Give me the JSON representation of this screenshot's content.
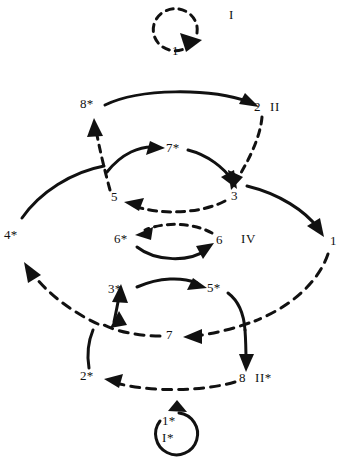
{
  "figure": {
    "type": "diagram",
    "style": "hand-drawn line diagram of two nested cycles",
    "stroke_color": "#111111",
    "background_color": "#ffffff"
  },
  "nodes": [
    {
      "id": "n1",
      "label": "1",
      "x": 176,
      "y": 50
    },
    {
      "id": "n8s",
      "label": "8*",
      "x": 86,
      "y": 104
    },
    {
      "id": "n2",
      "label": "2",
      "x": 258,
      "y": 108
    },
    {
      "id": "n7s",
      "label": "7*",
      "x": 172,
      "y": 148
    },
    {
      "id": "n5",
      "label": "5",
      "x": 115,
      "y": 198
    },
    {
      "id": "n3",
      "label": "3",
      "x": 234,
      "y": 196
    },
    {
      "id": "n4s",
      "label": "4*",
      "x": 8,
      "y": 235
    },
    {
      "id": "n6s",
      "label": "6*",
      "x": 120,
      "y": 239
    },
    {
      "id": "n6",
      "label": "6",
      "x": 220,
      "y": 240
    },
    {
      "id": "n1r",
      "label": "1",
      "x": 330,
      "y": 241
    },
    {
      "id": "n3s",
      "label": "3*",
      "x": 114,
      "y": 289
    },
    {
      "id": "n5s",
      "label": "5*",
      "x": 211,
      "y": 288
    },
    {
      "id": "n7",
      "label": "7",
      "x": 170,
      "y": 335
    },
    {
      "id": "n2s",
      "label": "2*",
      "x": 86,
      "y": 376
    },
    {
      "id": "n8",
      "label": "8",
      "x": 243,
      "y": 378
    },
    {
      "id": "n1s",
      "label": "1*",
      "x": 166,
      "y": 421
    }
  ],
  "roman_labels": [
    {
      "id": "r1",
      "label": "I",
      "x": 231,
      "y": 14
    },
    {
      "id": "r2",
      "label": "II",
      "x": 273,
      "y": 106
    },
    {
      "id": "r4",
      "label": "IV",
      "x": 245,
      "y": 238
    },
    {
      "id": "r2s",
      "label": "II*",
      "x": 259,
      "y": 377
    },
    {
      "id": "r1s",
      "label": "I*",
      "x": 166,
      "y": 437
    }
  ],
  "edges": [
    {
      "id": "e-1-1",
      "from": "1",
      "to": "1",
      "style": "dashed",
      "shape": "self-loop",
      "cycle": "I"
    },
    {
      "id": "e-8s-2",
      "from": "8*",
      "to": "2",
      "style": "solid",
      "shape": "arc-top"
    },
    {
      "id": "e-2-3",
      "from": "2",
      "to": "3",
      "style": "dashed",
      "shape": "line-down"
    },
    {
      "id": "e-3-5",
      "from": "3",
      "to": "5",
      "style": "dashed",
      "shape": "arc"
    },
    {
      "id": "e-5-8s",
      "from": "5",
      "to": "8*",
      "style": "dashed",
      "shape": "line-up"
    },
    {
      "id": "e-5-7s",
      "from": "5",
      "to": "7*",
      "style": "solid",
      "shape": "arc-up-right"
    },
    {
      "id": "e-7s-3",
      "from": "7*",
      "to": "3",
      "style": "solid",
      "shape": "arc-down-right"
    },
    {
      "id": "e-6-6s",
      "from": "6",
      "to": "6*",
      "style": "dashed",
      "shape": "arc-upper",
      "cycle": "IV"
    },
    {
      "id": "e-6s-6",
      "from": "6*",
      "to": "6",
      "style": "solid",
      "shape": "arc-lower",
      "cycle": "IV"
    },
    {
      "id": "e-4s-5",
      "from": "4*",
      "to": "5",
      "style": "solid",
      "shape": "outer-arc-upper-left"
    },
    {
      "id": "e-3-1r",
      "from": "3",
      "to": "1",
      "style": "solid",
      "shape": "outer-arc-upper-right"
    },
    {
      "id": "e-1r-7",
      "from": "1",
      "to": "7",
      "style": "dashed",
      "shape": "outer-arc-lower-right"
    },
    {
      "id": "e-7-3s",
      "from": "7",
      "to": "3*",
      "style": "dashed",
      "shape": "arc-left-up"
    },
    {
      "id": "e-3s-4s",
      "from": "3*",
      "to": "4*",
      "style": "dashed",
      "shape": "outer-arc-lower-left"
    },
    {
      "id": "e-3s-5s",
      "from": "3*",
      "to": "5*",
      "style": "solid",
      "shape": "arc"
    },
    {
      "id": "e-5s-8",
      "from": "5*",
      "to": "8",
      "style": "solid",
      "shape": "line-down"
    },
    {
      "id": "e-8-2s",
      "from": "8",
      "to": "2*",
      "style": "dashed",
      "shape": "arc-bottom"
    },
    {
      "id": "e-2s-3s",
      "from": "2*",
      "to": "3*",
      "style": "solid",
      "shape": "line-up"
    },
    {
      "id": "e-1s-1s",
      "from": "1*",
      "to": "1*",
      "style": "solid",
      "shape": "self-loop",
      "cycle": "I*"
    }
  ]
}
